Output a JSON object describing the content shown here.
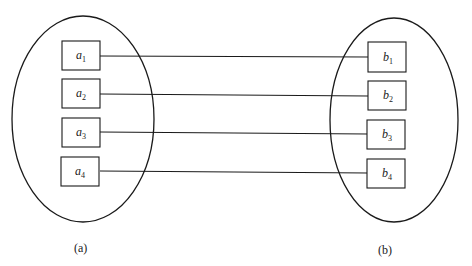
{
  "diagram": {
    "type": "mapping",
    "sets": [
      {
        "id": "a",
        "caption": "(a)",
        "elements": [
          {
            "base": "a",
            "sub": "1"
          },
          {
            "base": "a",
            "sub": "2"
          },
          {
            "base": "a",
            "sub": "3"
          },
          {
            "base": "a",
            "sub": "4"
          }
        ]
      },
      {
        "id": "b",
        "caption": "(b)",
        "elements": [
          {
            "base": "b",
            "sub": "1"
          },
          {
            "base": "b",
            "sub": "2"
          },
          {
            "base": "b",
            "sub": "3"
          },
          {
            "base": "b",
            "sub": "4"
          }
        ]
      }
    ],
    "edges": [
      {
        "from": "a1",
        "to": "b1"
      },
      {
        "from": "a2",
        "to": "b2"
      },
      {
        "from": "a3",
        "to": "b3"
      },
      {
        "from": "a4",
        "to": "b4"
      }
    ],
    "colors": {
      "stroke": "#1a1a1a",
      "background": "#ffffff"
    }
  }
}
